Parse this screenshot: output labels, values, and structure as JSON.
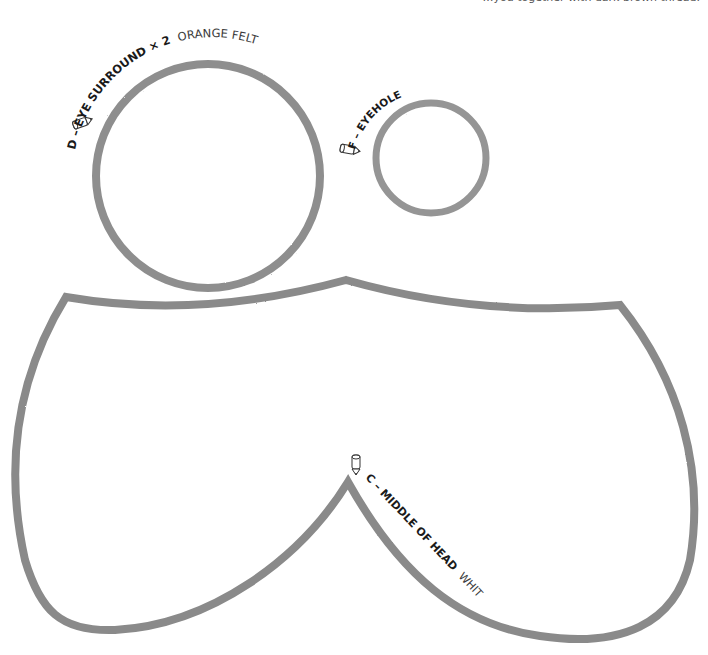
{
  "page": {
    "header_text_cropped": "…you together with dark brown thread.",
    "stroke_color": "#8c8c8c",
    "stroke_dark_color": "#6a6a6a"
  },
  "pieces": [
    {
      "id": "D",
      "name": "EYE SURROUND",
      "quantity": "× 2",
      "material": "ORANGE FELT",
      "label_bold": "D – EYE SURROUND × 2",
      "label_light": "ORANGE FELT",
      "shape": "circle",
      "center": [
        208,
        176
      ],
      "radius": 112,
      "icon": "pencil-icon"
    },
    {
      "id": "F",
      "name": "EYEHOLE",
      "label_bold": "F – EYEHOLE",
      "label_light": "",
      "shape": "circle",
      "center": [
        431,
        158
      ],
      "radius": 55,
      "icon": "pencil-icon"
    },
    {
      "id": "C",
      "name": "MIDDLE OF HEAD",
      "material": "WHITE FELT",
      "label_bold": "C – MIDDLE OF HEAD",
      "label_light": "WHITE FELT",
      "shape": "head-outline",
      "icon": "pencil-icon"
    }
  ]
}
